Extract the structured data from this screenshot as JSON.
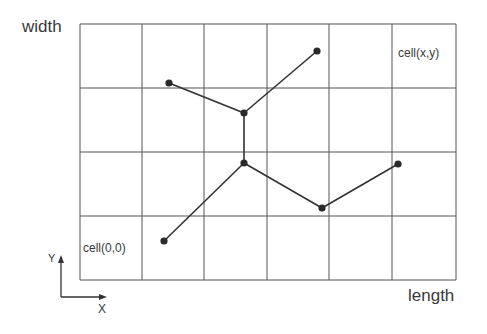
{
  "labels": {
    "width_axis": "width",
    "length_axis": "length",
    "cell_xy": "cell(x,y)",
    "cell_00": "cell(0,0)",
    "axis_y": "Y",
    "axis_x": "X"
  },
  "grid": {
    "columns": 6,
    "rows": 4,
    "x_lines": [
      80,
      142,
      204,
      267,
      329,
      392,
      456
    ],
    "y_lines": [
      24,
      88,
      152,
      216,
      280
    ],
    "line_color": "#555555"
  },
  "nodes": [
    {
      "id": "A",
      "x": 169,
      "y": 83
    },
    {
      "id": "B",
      "x": 244,
      "y": 113
    },
    {
      "id": "C",
      "x": 317,
      "y": 51
    },
    {
      "id": "D",
      "x": 244,
      "y": 163
    },
    {
      "id": "E",
      "x": 322,
      "y": 208
    },
    {
      "id": "F",
      "x": 398,
      "y": 164
    },
    {
      "id": "G",
      "x": 164,
      "y": 241
    }
  ],
  "edges": [
    [
      "A",
      "B"
    ],
    [
      "B",
      "C"
    ],
    [
      "B",
      "D"
    ],
    [
      "D",
      "E"
    ],
    [
      "E",
      "F"
    ],
    [
      "D",
      "G"
    ]
  ],
  "colors": {
    "node": "#2a2a2a",
    "edge": "#333333",
    "text": "#3a3a3a"
  }
}
